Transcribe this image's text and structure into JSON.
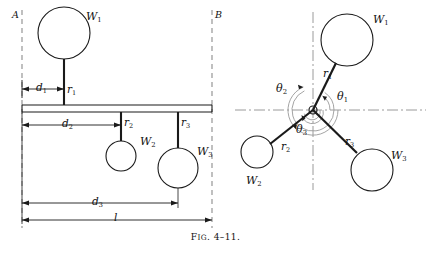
{
  "figure": {
    "caption_prefix": "F",
    "caption_smallcaps": "IG",
    "caption_rest": ". 4–11.",
    "caption_full": "Fig. 4–11.",
    "line_color": "#1a1a1a",
    "dash_color": "#8c8c8c",
    "background": "#ffffff"
  },
  "left_diagram": {
    "name": "shaft-side-view",
    "plane_labels": [
      {
        "id": "plane-a",
        "text": "A",
        "x": 12,
        "y": 10
      },
      {
        "id": "plane-b",
        "text": "B",
        "x": 215,
        "y": 10
      }
    ],
    "weights": [
      {
        "id": "w1",
        "label": "W",
        "sub": "1",
        "cx": 64,
        "cy": 33,
        "r": 26,
        "label_x": 86,
        "label_y": 11
      },
      {
        "id": "w2",
        "label": "W",
        "sub": "2",
        "cx": 121,
        "cy": 156,
        "r": 15,
        "label_x": 140,
        "label_y": 136
      },
      {
        "id": "w3",
        "label": "W",
        "sub": "3",
        "cx": 178,
        "cy": 168,
        "r": 20,
        "label_x": 197,
        "label_y": 146
      }
    ],
    "radii": [
      {
        "id": "r1",
        "label": "r",
        "sub": "1",
        "label_x": 67,
        "label_y": 84
      },
      {
        "id": "r2",
        "label": "r",
        "sub": "2",
        "label_x": 124,
        "label_y": 118
      },
      {
        "id": "r3",
        "label": "r",
        "sub": "3",
        "label_x": 181,
        "label_y": 118
      }
    ],
    "dimensions": [
      {
        "id": "d1",
        "label": "d",
        "sub": "1",
        "from_x": 22,
        "to_x": 64,
        "y": 89,
        "label_x": 36,
        "label_y": 83
      },
      {
        "id": "d2",
        "label": "d",
        "sub": "2",
        "from_x": 22,
        "to_x": 121,
        "y": 125,
        "label_x": 62,
        "label_y": 118
      },
      {
        "id": "d3",
        "label": "d",
        "sub": "3",
        "from_x": 22,
        "to_x": 178,
        "y": 203,
        "label_x": 92,
        "label_y": 196
      },
      {
        "id": "l",
        "label": "l",
        "sub": "",
        "from_x": 22,
        "to_x": 212,
        "y": 220,
        "label_x": 114,
        "label_y": 213
      }
    ],
    "shaft": {
      "x1": 22,
      "x2": 212,
      "y_top": 105,
      "y_bottom": 112
    }
  },
  "right_diagram": {
    "name": "end-view-vector-diagram",
    "hub": {
      "cx": 313,
      "cy": 110,
      "r": 4
    },
    "weights": [
      {
        "id": "w1",
        "label": "W",
        "sub": "1",
        "cx": 347,
        "cy": 40,
        "r": 26,
        "label_x": 373,
        "label_y": 14
      },
      {
        "id": "w2",
        "label": "W",
        "sub": "2",
        "cx": 257,
        "cy": 152,
        "r": 16,
        "label_x": 246,
        "label_y": 175
      },
      {
        "id": "w3",
        "label": "W",
        "sub": "3",
        "cx": 372,
        "cy": 170,
        "r": 21,
        "label_x": 391,
        "label_y": 150
      }
    ],
    "radii": [
      {
        "id": "r1",
        "label": "r",
        "sub": "1",
        "label_x": 323,
        "label_y": 69
      },
      {
        "id": "r2",
        "label": "r",
        "sub": "2",
        "label_x": 281,
        "label_y": 142
      },
      {
        "id": "r3",
        "label": "r",
        "sub": "3",
        "label_x": 345,
        "label_y": 137
      }
    ],
    "angles": [
      {
        "id": "theta1",
        "label": "θ",
        "sub": "1",
        "label_x": 337,
        "label_y": 92,
        "arc_r": 17
      },
      {
        "id": "theta2",
        "label": "θ",
        "sub": "2",
        "label_x": 276,
        "label_y": 84,
        "arc_r": 25
      },
      {
        "id": "theta3",
        "label": "θ",
        "sub": "3",
        "label_x": 296,
        "label_y": 125,
        "arc_r": 10
      }
    ]
  }
}
